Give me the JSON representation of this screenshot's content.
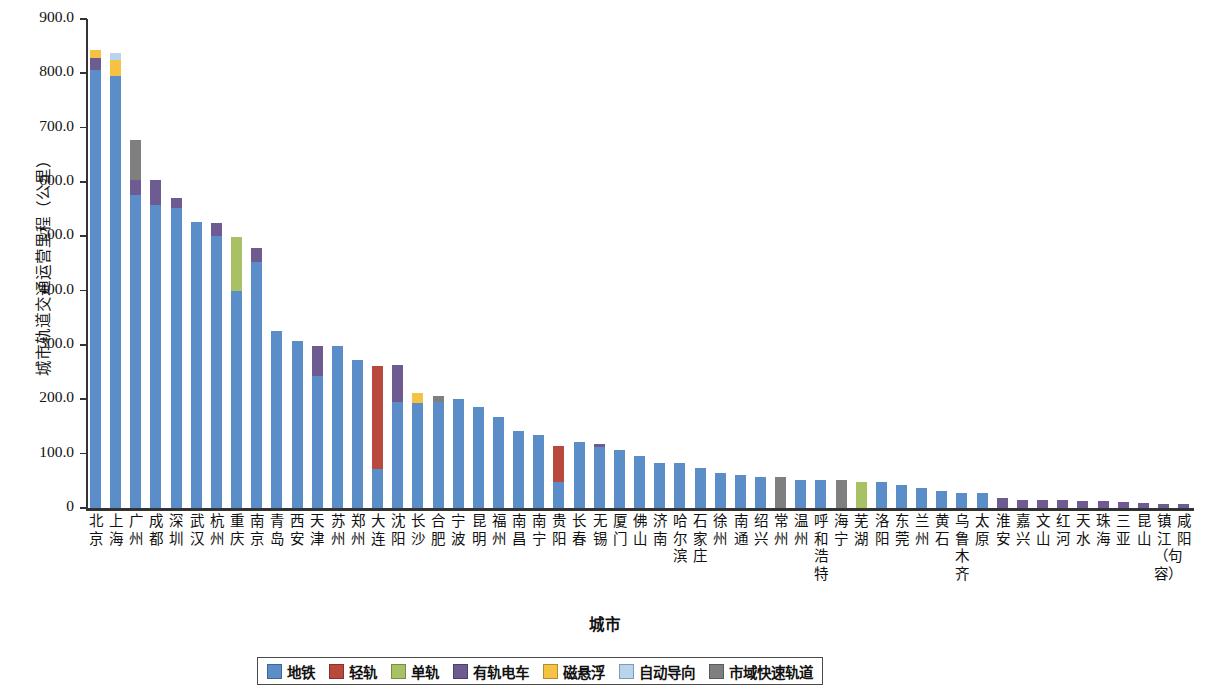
{
  "chart_data": {
    "type": "bar",
    "stacked": true,
    "title": "",
    "xlabel": "城市",
    "ylabel": "城市轨道交通运营里程（公里）",
    "ylim": [
      0,
      900
    ],
    "ytick_labels": [
      "0",
      "100.0",
      "200.0",
      "300.0",
      "400.0",
      "500.0",
      "600.0",
      "700.0",
      "800.0",
      "900.0"
    ],
    "ytick_values": [
      0,
      100,
      200,
      300,
      400,
      500,
      600,
      700,
      800,
      900
    ],
    "grid": false,
    "legend_position": "bottom",
    "categories": [
      "北京",
      "上海",
      "广州",
      "成都",
      "深圳",
      "武汉",
      "杭州",
      "重庆",
      "南京",
      "青岛",
      "西安",
      "天津",
      "苏州",
      "郑州",
      "大连",
      "沈阳",
      "长沙",
      "合肥",
      "宁波",
      "昆明",
      "福州",
      "南昌",
      "南宁",
      "贵阳",
      "长春",
      "无锡",
      "厦门",
      "佛山",
      "济南",
      "哈尔滨",
      "石家庄",
      "徐州",
      "南通",
      "绍兴",
      "常州",
      "温州",
      "呼和浩特",
      "海宁",
      "芜湖",
      "洛阳",
      "东莞",
      "兰州",
      "黄石",
      "乌鲁木齐",
      "太原",
      "淮安",
      "嘉兴",
      "文山",
      "红河",
      "天水",
      "珠海",
      "三亚",
      "昆山",
      "镇江（句容）",
      "咸阳"
    ],
    "series": [
      {
        "name": "地铁",
        "color": "#5b8dc8",
        "values": [
          807,
          795,
          576,
          558,
          553,
          527,
          500,
          400,
          453,
          325,
          308,
          243,
          299,
          273,
          72,
          195,
          193,
          196,
          200,
          186,
          167,
          141,
          135,
          48,
          121,
          112,
          107,
          96,
          82,
          82,
          74,
          64,
          60,
          58,
          0,
          52,
          52,
          0,
          0,
          47,
          43,
          36,
          32,
          28,
          27,
          0,
          0,
          0,
          0,
          0,
          0,
          0,
          0,
          0,
          0
        ]
      },
      {
        "name": "轻轨",
        "color": "#b9493c",
        "values": [
          0,
          0,
          0,
          0,
          0,
          0,
          0,
          0,
          0,
          0,
          0,
          0,
          0,
          0,
          190,
          0,
          0,
          0,
          0,
          0,
          0,
          0,
          0,
          66,
          0,
          0,
          0,
          0,
          0,
          0,
          0,
          0,
          0,
          0,
          0,
          0,
          0,
          0,
          0,
          0,
          0,
          0,
          0,
          0,
          0,
          0,
          0,
          0,
          0,
          0,
          0,
          0,
          0,
          0,
          0
        ]
      },
      {
        "name": "单轨",
        "color": "#a8c164",
        "values": [
          0,
          0,
          0,
          0,
          0,
          0,
          0,
          98,
          0,
          0,
          0,
          0,
          0,
          0,
          0,
          0,
          0,
          0,
          0,
          0,
          0,
          0,
          0,
          0,
          0,
          0,
          0,
          0,
          0,
          0,
          0,
          0,
          0,
          0,
          0,
          0,
          0,
          0,
          48,
          0,
          0,
          0,
          0,
          0,
          0,
          0,
          0,
          0,
          0,
          0,
          0,
          0,
          0,
          0,
          0
        ]
      },
      {
        "name": "有轨电车",
        "color": "#6d5b92",
        "values": [
          22,
          0,
          28,
          46,
          18,
          0,
          25,
          0,
          25,
          0,
          0,
          56,
          0,
          0,
          0,
          68,
          0,
          0,
          0,
          0,
          0,
          0,
          0,
          0,
          0,
          6,
          0,
          0,
          0,
          0,
          0,
          0,
          0,
          0,
          0,
          0,
          0,
          0,
          0,
          0,
          0,
          0,
          0,
          0,
          0,
          18,
          14,
          14,
          14,
          13,
          12,
          11,
          10,
          8,
          7
        ]
      },
      {
        "name": "磁悬浮",
        "color": "#f5c244",
        "values": [
          14,
          30,
          0,
          0,
          0,
          0,
          0,
          0,
          0,
          0,
          0,
          0,
          0,
          0,
          0,
          0,
          18,
          0,
          0,
          0,
          0,
          0,
          0,
          0,
          0,
          0,
          0,
          0,
          0,
          0,
          0,
          0,
          0,
          0,
          0,
          0,
          0,
          0,
          0,
          0,
          0,
          0,
          0,
          0,
          0,
          0,
          0,
          0,
          0,
          0,
          0,
          0,
          0,
          0,
          0
        ]
      },
      {
        "name": "自动导向",
        "color": "#b9d4ef",
        "values": [
          0,
          12,
          0,
          0,
          0,
          0,
          0,
          0,
          0,
          0,
          0,
          0,
          0,
          0,
          0,
          0,
          0,
          0,
          0,
          0,
          0,
          0,
          0,
          0,
          0,
          0,
          0,
          0,
          0,
          0,
          0,
          0,
          0,
          0,
          0,
          0,
          0,
          0,
          0,
          0,
          0,
          0,
          0,
          0,
          0,
          0,
          0,
          0,
          0,
          0,
          0,
          0,
          0,
          0,
          0
        ]
      },
      {
        "name": "市域快速轨道",
        "color": "#7f7f7f",
        "values": [
          0,
          0,
          74,
          0,
          0,
          0,
          0,
          0,
          0,
          0,
          0,
          0,
          0,
          0,
          0,
          0,
          0,
          10,
          0,
          0,
          0,
          0,
          0,
          0,
          0,
          0,
          0,
          0,
          0,
          0,
          0,
          0,
          0,
          0,
          58,
          0,
          0,
          52,
          0,
          0,
          0,
          0,
          0,
          0,
          0,
          0,
          0,
          0,
          0,
          0,
          0,
          0,
          0,
          0,
          0
        ]
      }
    ]
  },
  "legend": {
    "items": [
      {
        "label": "地铁",
        "color": "#5b8dc8"
      },
      {
        "label": "轻轨",
        "color": "#b9493c"
      },
      {
        "label": "单轨",
        "color": "#a8c164"
      },
      {
        "label": "有轨电车",
        "color": "#6d5b92"
      },
      {
        "label": "磁悬浮",
        "color": "#f5c244"
      },
      {
        "label": "自动导向",
        "color": "#b9d4ef"
      },
      {
        "label": "市域快速轨道",
        "color": "#7f7f7f"
      }
    ]
  }
}
